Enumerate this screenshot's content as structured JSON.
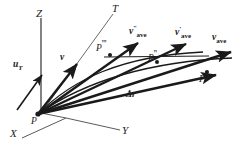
{
  "figure": {
    "kind": "vector-diagram",
    "caption_absent": true,
    "background_color": "#ffffff",
    "stroke_color": "#1a1a1a",
    "axis_color": "#555555",
    "width": 248,
    "height": 155
  },
  "axes": [
    {
      "id": "z",
      "label": "Z",
      "x": 36,
      "y": 8
    },
    {
      "id": "x",
      "label": "X",
      "x": 10,
      "y": 131
    },
    {
      "id": "y",
      "label": "Y",
      "x": 122,
      "y": 128
    },
    {
      "id": "t",
      "label": "T",
      "x": 112,
      "y": 4
    }
  ],
  "points": [
    {
      "id": "origin",
      "label": "P",
      "prime": "",
      "x": 36,
      "y": 113
    },
    {
      "id": "p3",
      "label": "P",
      "prime": "'''",
      "x": 102,
      "y": 42
    },
    {
      "id": "p2",
      "label": "P",
      "prime": "''",
      "x": 150,
      "y": 53
    },
    {
      "id": "p1",
      "label": "P",
      "prime": "'",
      "x": 200,
      "y": 74
    }
  ],
  "vectors": [
    {
      "id": "u-t",
      "label": "u",
      "sub": "T",
      "sup": "",
      "x": 15,
      "y": 62
    },
    {
      "id": "v",
      "label": "v",
      "sub": "",
      "sup": "",
      "x": 61,
      "y": 55
    },
    {
      "id": "v-ave-3",
      "label": "v",
      "sub": "ave",
      "sup": "''",
      "x": 131,
      "y": 26
    },
    {
      "id": "v-ave-2",
      "label": "v",
      "sub": "ave",
      "sup": "'",
      "x": 176,
      "y": 27
    },
    {
      "id": "v-ave-1",
      "label": "v",
      "sub": "ave",
      "sup": "",
      "x": 214,
      "y": 34
    },
    {
      "id": "delta-r",
      "label": "Δr",
      "sub": "",
      "sup": "",
      "x": 127,
      "y": 92
    }
  ]
}
